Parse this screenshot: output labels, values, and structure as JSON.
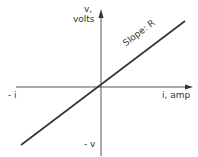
{
  "diagram": {
    "vertical_axis": {
      "label_line1": "v,",
      "label_line2": "volts",
      "negative_label": "- v"
    },
    "horizontal_axis": {
      "label": "i, amp",
      "negative_label": "- i"
    },
    "line": {
      "annotation": "Slope: R",
      "passes_through_origin": true
    },
    "colors": {
      "ink": "#333333",
      "background": "#ffffff"
    }
  }
}
